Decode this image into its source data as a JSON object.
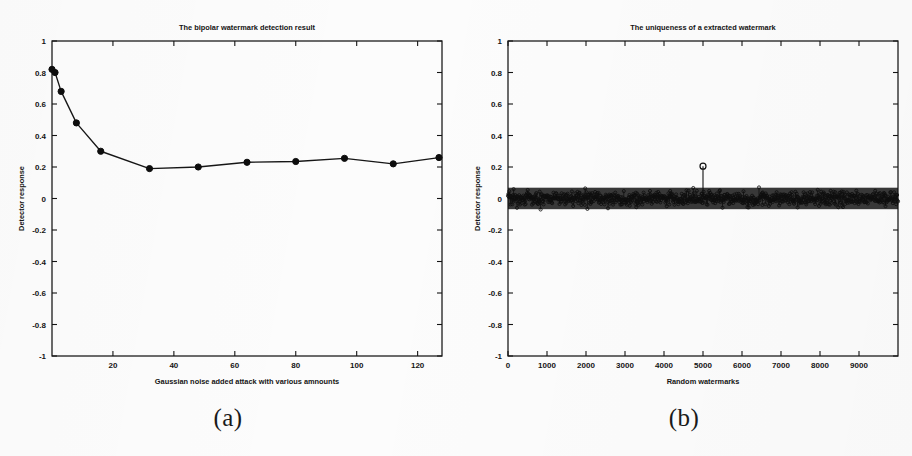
{
  "figure": {
    "panels": [
      {
        "id": "a",
        "caption": "(a)",
        "chart_data": {
          "type": "line",
          "title": "The bipolar watermark detection result",
          "xlabel": "Gaussian noise added attack with various amnounts",
          "ylabel": "Detector response",
          "xlim": [
            0,
            128
          ],
          "ylim": [
            -1,
            1
          ],
          "xticks": [
            20,
            40,
            60,
            80,
            100,
            120
          ],
          "xticklabels": [
            "20",
            "40",
            "60",
            "80",
            "100",
            "120"
          ],
          "yticks": [
            -1,
            -0.8,
            -0.6,
            -0.4,
            -0.2,
            0,
            0.2,
            0.4,
            0.6,
            0.8,
            1
          ],
          "yticklabels": [
            "-1",
            "-0.8",
            "-0.6",
            "-0.4",
            "-0.2",
            "0",
            "0.2",
            "0.4",
            "0.6",
            "0.8",
            "1"
          ],
          "grid": false,
          "legend": null,
          "marker": "circle",
          "line_color": "#161616",
          "x": [
            0,
            1,
            3,
            8,
            16,
            32,
            48,
            64,
            80,
            96,
            112,
            127
          ],
          "y": [
            0.82,
            0.8,
            0.68,
            0.48,
            0.3,
            0.19,
            0.2,
            0.23,
            0.235,
            0.255,
            0.22,
            0.26
          ]
        }
      },
      {
        "id": "b",
        "caption": "(b)",
        "chart_data": {
          "type": "scatter",
          "title": "The uniqueness of a extracted watermark",
          "xlabel": "Random watermarks",
          "ylabel": "Detector response",
          "xlim": [
            0,
            10000
          ],
          "ylim": [
            -1,
            1
          ],
          "xticks": [
            0,
            1000,
            2000,
            3000,
            4000,
            5000,
            6000,
            7000,
            8000,
            9000
          ],
          "xticklabels": [
            "0",
            "1000",
            "2000",
            "3000",
            "4000",
            "5000",
            "6000",
            "7000",
            "8000",
            "9000"
          ],
          "yticks": [
            -1,
            -0.8,
            -0.6,
            -0.4,
            -0.2,
            0,
            0.2,
            0.4,
            0.6,
            0.8,
            1
          ],
          "yticklabels": [
            "-1",
            "-0.8",
            "-0.6",
            "-0.4",
            "-0.2",
            "0",
            "0.2",
            "0.4",
            "0.6",
            "0.8",
            "1"
          ],
          "grid": false,
          "legend": null,
          "marker": "circle",
          "line_color": "#111111",
          "noise_band": {
            "description": "dense stem plot of random detector responses",
            "n_points": 10000,
            "spread": 0.095,
            "center": 0.0
          },
          "spike": {
            "x": 5000,
            "y": 0.205
          }
        }
      }
    ]
  },
  "colors": {
    "ink": "#141414",
    "paper": "#fcfcfc",
    "axis": "#1c1c1c"
  }
}
